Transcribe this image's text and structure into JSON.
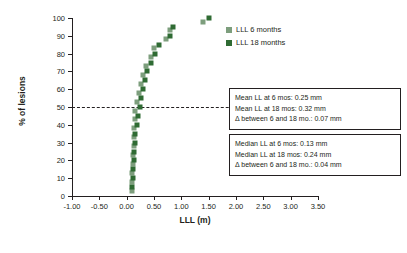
{
  "chart_data": {
    "type": "scatter",
    "title": "",
    "xlabel": "LLL (m)",
    "ylabel": "% of lesions",
    "xlim": [
      -1.0,
      3.5
    ],
    "ylim": [
      0,
      100
    ],
    "grid": false,
    "legend_position": "top-right",
    "xticks": [
      "-1.00",
      "-0.50",
      "0.00",
      "0.50",
      "1.00",
      "1.50",
      "2.00",
      "2.50",
      "3.00",
      "3.50"
    ],
    "yticks": [
      "0",
      "10",
      "20",
      "30",
      "40",
      "50",
      "60",
      "70",
      "80",
      "90",
      "100"
    ],
    "reference_line": {
      "axis": "y",
      "value": 50,
      "style": "dashed"
    },
    "series": [
      {
        "name": "LLL 6 months",
        "color": "#7d9e7d",
        "points": [
          {
            "x": 0.1,
            "y": 3
          },
          {
            "x": 0.1,
            "y": 8
          },
          {
            "x": 0.1,
            "y": 13
          },
          {
            "x": 0.12,
            "y": 18
          },
          {
            "x": 0.12,
            "y": 23
          },
          {
            "x": 0.13,
            "y": 28
          },
          {
            "x": 0.13,
            "y": 33
          },
          {
            "x": 0.14,
            "y": 38
          },
          {
            "x": 0.15,
            "y": 43
          },
          {
            "x": 0.16,
            "y": 48
          },
          {
            "x": 0.18,
            "y": 53
          },
          {
            "x": 0.22,
            "y": 58
          },
          {
            "x": 0.26,
            "y": 63
          },
          {
            "x": 0.3,
            "y": 68
          },
          {
            "x": 0.36,
            "y": 73
          },
          {
            "x": 0.44,
            "y": 78
          },
          {
            "x": 0.5,
            "y": 83
          },
          {
            "x": 0.72,
            "y": 88
          },
          {
            "x": 0.8,
            "y": 93
          },
          {
            "x": 1.4,
            "y": 98
          }
        ]
      },
      {
        "name": "LLL 18 months",
        "color": "#2f6b33",
        "points": [
          {
            "x": 0.1,
            "y": 5
          },
          {
            "x": 0.11,
            "y": 10
          },
          {
            "x": 0.12,
            "y": 15
          },
          {
            "x": 0.13,
            "y": 20
          },
          {
            "x": 0.14,
            "y": 25
          },
          {
            "x": 0.15,
            "y": 30
          },
          {
            "x": 0.16,
            "y": 35
          },
          {
            "x": 0.18,
            "y": 40
          },
          {
            "x": 0.2,
            "y": 45
          },
          {
            "x": 0.24,
            "y": 50
          },
          {
            "x": 0.26,
            "y": 55
          },
          {
            "x": 0.3,
            "y": 60
          },
          {
            "x": 0.34,
            "y": 65
          },
          {
            "x": 0.38,
            "y": 70
          },
          {
            "x": 0.44,
            "y": 75
          },
          {
            "x": 0.52,
            "y": 80
          },
          {
            "x": 0.6,
            "y": 85
          },
          {
            "x": 0.8,
            "y": 90
          },
          {
            "x": 0.84,
            "y": 95
          },
          {
            "x": 1.5,
            "y": 100
          }
        ]
      }
    ],
    "annotations": [
      {
        "id": "mean-box",
        "lines": [
          "Mean LL at 6 mos: 0.25 mm",
          "Mean LL at 18 mos: 0.32 mm",
          "Δ between 6 and 18 mo.: 0.07 mm"
        ]
      },
      {
        "id": "median-box",
        "lines": [
          "Median LL at 6 mos: 0.13 mm",
          "Median LL at 18 mos: 0.24 mm",
          "Δ between 6 and 18 mo.: 0.04 mm"
        ]
      }
    ]
  },
  "legend": {
    "items": [
      {
        "label": "LLL 6 months"
      },
      {
        "label": "LLL 18 months"
      }
    ]
  },
  "anno_mean": {
    "line1": "Mean LL at 6 mos: 0.25 mm",
    "line2": "Mean LL at 18 mos: 0.32 mm",
    "line3": "Δ between 6 and 18 mo.: 0.07 mm"
  },
  "anno_median": {
    "line1": "Median LL at 6 mos: 0.13 mm",
    "line2": "Median LL at 18 mos: 0.24 mm",
    "line3": "Δ between 6 and 18 mo.: 0.04 mm"
  }
}
